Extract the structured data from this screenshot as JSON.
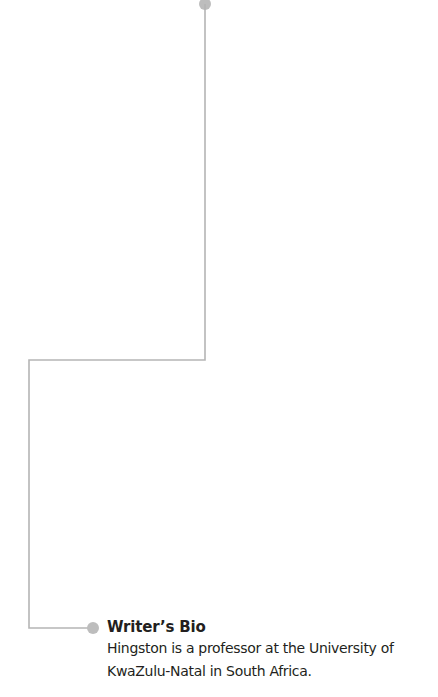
{
  "bio": {
    "title": "Writer’s Bio",
    "text": "Hingston is a professor at the University of KwaZulu-Natal in South Africa.",
    "line1": "Hingston is a professor at the University of",
    "line2": "KwaZulu-Natal in South Africa."
  },
  "colors": {
    "line": "#b5b5b5",
    "dot": "#b8b8b8",
    "text": "#231f20"
  }
}
